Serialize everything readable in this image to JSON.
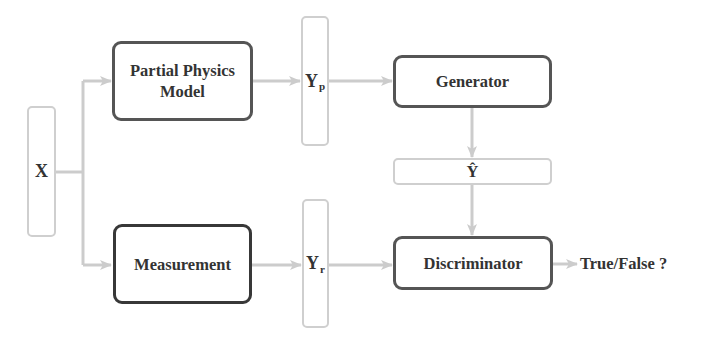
{
  "diagram": {
    "nodes": {
      "x": {
        "label": "X"
      },
      "partial_physics": {
        "label_line1": "Partial Physics",
        "label_line2": "Model"
      },
      "measurement": {
        "label": "Measurement"
      },
      "yp": {
        "label": "Y",
        "subscript": "p"
      },
      "yr": {
        "label": "Y",
        "subscript": "r"
      },
      "generator": {
        "label": "Generator"
      },
      "yhat": {
        "label": "Ŷ"
      },
      "discriminator": {
        "label": "Discriminator"
      }
    },
    "output": {
      "label": "True/False ?"
    },
    "edges": [
      {
        "from": "X",
        "to": "Partial Physics Model"
      },
      {
        "from": "X",
        "to": "Measurement"
      },
      {
        "from": "Partial Physics Model",
        "to": "Yp"
      },
      {
        "from": "Measurement",
        "to": "Yr"
      },
      {
        "from": "Yp",
        "to": "Generator"
      },
      {
        "from": "Generator",
        "to": "Ŷ"
      },
      {
        "from": "Ŷ",
        "to": "Discriminator"
      },
      {
        "from": "Yr",
        "to": "Discriminator"
      },
      {
        "from": "Discriminator",
        "to": "True/False ?"
      }
    ],
    "colors": {
      "wire": "#cccccc",
      "box_border": "#555555",
      "vector_border": "#cfcfcf",
      "text": "#333333"
    }
  }
}
